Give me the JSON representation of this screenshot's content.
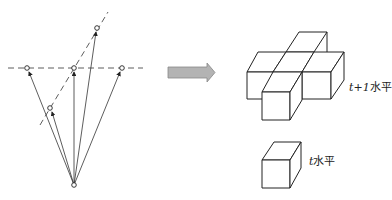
{
  "diagram": {
    "left_panel": {
      "description": "vectors from origin to points on two dashed lines",
      "origin": {
        "x": 74,
        "y": 185
      },
      "horizontal_line": {
        "y": 68,
        "x1": 8,
        "x2": 143
      },
      "oblique_line": {
        "x1": 40,
        "y1": 125,
        "x2": 108,
        "y2": 12
      },
      "points": [
        {
          "x": 27,
          "y": 68
        },
        {
          "x": 74,
          "y": 68
        },
        {
          "x": 122,
          "y": 68
        },
        {
          "x": 97,
          "y": 28
        },
        {
          "x": 50,
          "y": 108
        }
      ]
    },
    "arrow": {
      "x1": 168,
      "x2": 215,
      "y": 72,
      "color": "#a9a9a9"
    },
    "right_panel": {
      "upper_label_var": "t+1",
      "upper_label_text": "水平",
      "lower_label_var": "t",
      "lower_label_text": "水平"
    },
    "colors": {
      "stroke": "#222222",
      "arrow_fill": "#b3b3b3"
    }
  }
}
